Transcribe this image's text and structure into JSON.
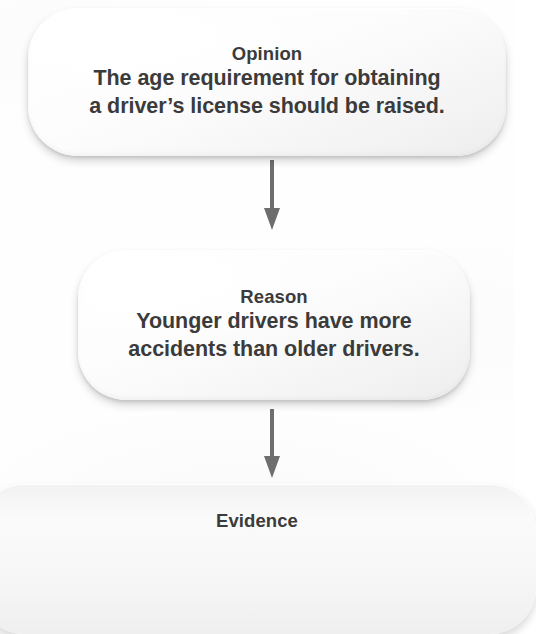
{
  "diagram": {
    "type": "flowchart",
    "title_visible": false,
    "orientation": "vertical-top-to-bottom",
    "accent_color": "#6e6e6e",
    "text_color": "#3b3b3b",
    "node_fill": "#fbfbfb",
    "background": "#fefefe",
    "nodes": [
      {
        "id": "opinion",
        "label": "Opinion",
        "text": "The age requirement for obtaining\na driver’s license should be raised.",
        "cropped": false
      },
      {
        "id": "reason",
        "label": "Reason",
        "text": "Younger drivers have more\naccidents than older drivers.",
        "cropped": false
      },
      {
        "id": "evidence",
        "label": "Evidence",
        "text": "",
        "cropped": true
      }
    ],
    "connectors": [
      {
        "id": "opinion-to-reason",
        "from": "opinion",
        "to": "reason",
        "icon": "down-arrow-icon"
      },
      {
        "id": "reason-to-evidence",
        "from": "reason",
        "to": "evidence",
        "icon": "down-arrow-icon"
      }
    ]
  }
}
